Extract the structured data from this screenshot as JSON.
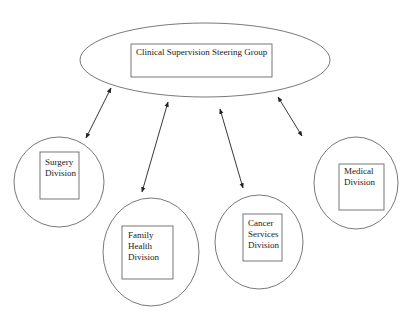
{
  "diagram": {
    "title": "Clinical Supervision Steering Group",
    "colors": {
      "stroke": "#555555",
      "arrow": "#222222",
      "text": "#1a1a1a",
      "background": "#ffffff"
    },
    "hub": {
      "label": "Clinical Supervision Steering Group",
      "shape": "ellipse"
    },
    "divisions": [
      {
        "id": "surgery",
        "label_lines": [
          "Surgery",
          "Division"
        ]
      },
      {
        "id": "family-health",
        "label_lines": [
          "Family",
          "Health",
          "Division"
        ]
      },
      {
        "id": "cancer-services",
        "label_lines": [
          "Cancer",
          "Services",
          "Division"
        ]
      },
      {
        "id": "medical",
        "label_lines": [
          "Medical",
          "Division"
        ]
      }
    ],
    "connections": [
      {
        "from": "hub",
        "to": "surgery",
        "type": "bidirectional-arrow"
      },
      {
        "from": "hub",
        "to": "family-health",
        "type": "bidirectional-arrow"
      },
      {
        "from": "hub",
        "to": "cancer-services",
        "type": "bidirectional-arrow"
      },
      {
        "from": "hub",
        "to": "medical",
        "type": "bidirectional-arrow"
      }
    ]
  }
}
